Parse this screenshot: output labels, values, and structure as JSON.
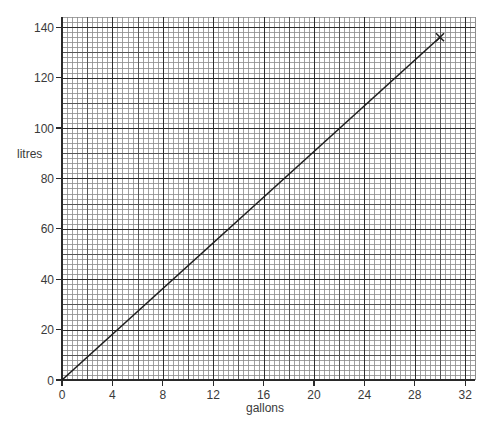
{
  "chart_data": {
    "type": "line",
    "title": "",
    "xlabel": "gallons",
    "ylabel": "litres",
    "xlim": [
      0,
      32.8
    ],
    "ylim": [
      0,
      144
    ],
    "grid": true,
    "grid_style": {
      "minor_x_step": 0.4,
      "minor_y_step": 2,
      "medium_x_step": 2,
      "medium_y_step": 10,
      "major_x_step": 4,
      "major_y_step": 20
    },
    "x_ticks": [
      0,
      4,
      8,
      12,
      16,
      20,
      24,
      28,
      32
    ],
    "x_tick_labels": [
      "0",
      "4",
      "8",
      "12",
      "16",
      "20",
      "24",
      "28",
      "32"
    ],
    "y_ticks": [
      0,
      20,
      40,
      60,
      80,
      100,
      120,
      140
    ],
    "y_tick_labels": [
      "0",
      "20",
      "40",
      "60",
      "80",
      "100",
      "120",
      "140"
    ],
    "series": [
      {
        "name": "gallons to litres conversion",
        "x": [
          0,
          30
        ],
        "values": [
          0,
          136
        ],
        "end_marker": "cross"
      }
    ],
    "annotations": [
      {
        "type": "marker",
        "shape": "x",
        "x": 30,
        "y": 136
      }
    ],
    "legend": null
  },
  "colors": {
    "background": "#ffffff",
    "minor_grid": "#8a8a8a",
    "medium_grid": "#555555",
    "major_grid": "#2e2e2e",
    "axis": "#2a2a2a",
    "line": "#1e1e1e",
    "text": "#3a3a3a"
  }
}
